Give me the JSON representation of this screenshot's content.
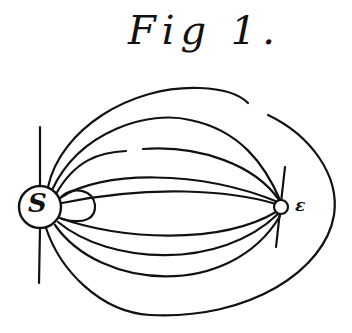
{
  "figure": {
    "title": "Fig 1.",
    "labels": {
      "sun": "S",
      "earth": "ε"
    },
    "elements": [
      {
        "name": "sun",
        "shape": "circle",
        "label": "S"
      },
      {
        "name": "earth",
        "shape": "small circle",
        "label": "ε"
      },
      {
        "name": "axis-line",
        "shape": "vertical line through sun"
      },
      {
        "name": "field-lines",
        "count_upper": 4,
        "count_lower": 4,
        "description": "curved lines connecting sun to earth"
      },
      {
        "name": "outer-loop",
        "description": "large oval line from sun enclosing earth"
      },
      {
        "name": "small-loop",
        "description": "small closed loop adjacent to sun on the right"
      }
    ],
    "ink_color": "#111111",
    "background": "#ffffff"
  }
}
